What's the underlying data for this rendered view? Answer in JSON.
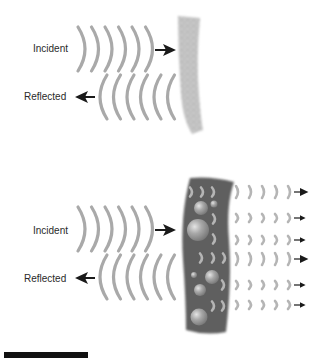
{
  "figure": {
    "top_panel": {
      "incident_label": "Incident",
      "reflected_label": "Reflected",
      "surface": "rough-wall"
    },
    "bottom_panel": {
      "incident_label": "Incident",
      "reflected_label": "Reflected",
      "surface": "porous-absorber",
      "transmitted_rows": 6
    },
    "caption_fragment": "I ... diff ... t ... t ... d"
  },
  "colors": {
    "wave": "#a9a9a9",
    "arrow": "#1a1a1a",
    "wall_light": "#c8c8c8",
    "absorber_dark": "#5a5a5a",
    "bubble": "#a0a0a0"
  }
}
